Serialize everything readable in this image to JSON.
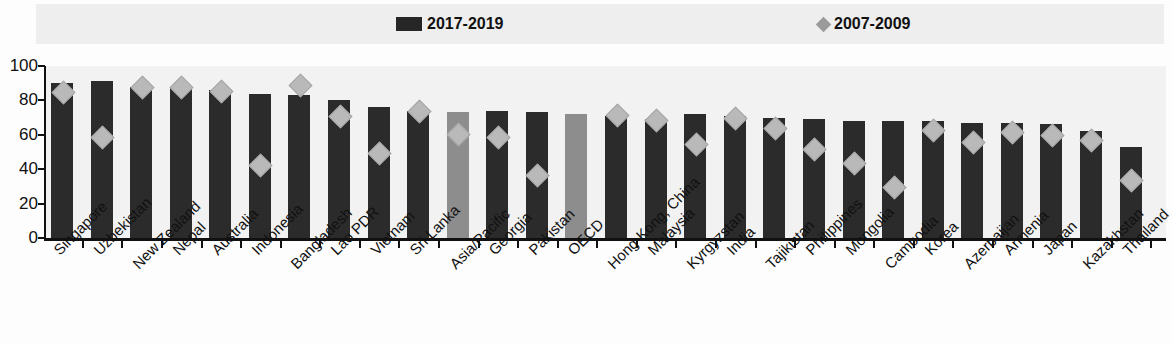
{
  "legend": {
    "items": [
      {
        "label": "2017-2019",
        "marker": "bar-swatch",
        "color": "#262626"
      },
      {
        "label": "2007-2009",
        "marker": "diamond-swatch",
        "color": "#9a9a9a"
      }
    ]
  },
  "axis": {
    "y_ticks": [
      "100",
      "80",
      "60",
      "40",
      "20",
      "0"
    ],
    "y_min": 0,
    "y_max": 100
  },
  "colors": {
    "bar_dark": "#2b2b2b",
    "bar_gray": "#8d8d8d",
    "diamond": "#b9b9b9",
    "legend_band": "#eeeeee",
    "plot_bg": "#f2f2f2",
    "axis": "#111111"
  },
  "chart_data": {
    "type": "bar",
    "title": "",
    "subtitle": "",
    "xlabel": "",
    "ylabel": "",
    "ylim": [
      0,
      100
    ],
    "grid": false,
    "legend_position": "top",
    "categories": [
      "Singapore",
      "Uzbekistan",
      "New Zealand",
      "Nepal",
      "Australia",
      "Indonesia",
      "Bangladesh",
      "Lao PDR",
      "Vietnam",
      "Sri Lanka",
      "Asia/Pacific",
      "Georgia",
      "Pakistan",
      "OECD",
      "Hong Kong, China",
      "Malaysia",
      "Kyrgyzstan",
      "India",
      "Tajikistan",
      "Philippines",
      "Mongolia",
      "Cambodia",
      "Korea",
      "Azerbaijan",
      "Armenia",
      "Japan",
      "Kazakhstan",
      "Thailand"
    ],
    "highlighted_categories": [
      "Asia/Pacific",
      "OECD"
    ],
    "series": [
      {
        "name": "2017-2019",
        "type": "bar",
        "color": "#2b2b2b",
        "values": [
          90,
          91,
          88,
          88,
          86,
          84,
          83,
          80,
          76,
          74,
          73,
          74,
          73,
          72,
          71,
          69,
          72,
          71,
          70,
          69,
          68,
          68,
          68,
          67,
          67,
          66,
          62,
          53
        ]
      },
      {
        "name": "2007-2009",
        "type": "scatter-diamond",
        "color": "#b9b9b9",
        "values": [
          85,
          59,
          88,
          88,
          86,
          43,
          89,
          71,
          50,
          74,
          61,
          59,
          37,
          null,
          72,
          69,
          55,
          70,
          64,
          52,
          44,
          30,
          63,
          56,
          62,
          60,
          57,
          34
        ]
      }
    ]
  }
}
